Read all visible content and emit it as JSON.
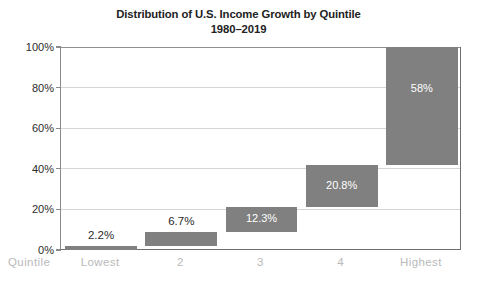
{
  "chart_data": {
    "type": "bar",
    "chart_subtype": "waterfall",
    "title": "Distribution of U.S. Income Growth by Quintile",
    "subtitle": "1980–2019",
    "xlabel": "Quintile",
    "ylabel": "",
    "categories": [
      "Lowest",
      "2",
      "3",
      "4",
      "Highest"
    ],
    "values": [
      2.2,
      6.7,
      12.3,
      20.8,
      58
    ],
    "data_labels": [
      "2.2%",
      "6.7%",
      "12.3%",
      "20.8%",
      "58%"
    ],
    "label_placement": [
      "outside-above",
      "outside-above",
      "inside",
      "inside",
      "inside"
    ],
    "cumulative_start": [
      0,
      2.2,
      8.9,
      21.2,
      42.0
    ],
    "cumulative_end": [
      2.2,
      8.9,
      21.2,
      42.0,
      100.0
    ],
    "ylim": [
      0,
      100
    ],
    "yticks": [
      0,
      20,
      40,
      60,
      80,
      100
    ],
    "ytick_labels": [
      "0%",
      "20%",
      "40%",
      "60%",
      "80%",
      "100%"
    ],
    "grid": true,
    "legend": false,
    "bar_color": "#808080",
    "gridline_color": "#d4d4d4",
    "axis_color": "#6f6f6f",
    "title_color": "#222222",
    "xlabel_color": "#b9b9b9",
    "background_color": "#ffffff"
  }
}
